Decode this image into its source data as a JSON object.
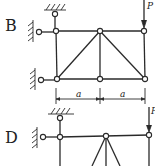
{
  "figure": {
    "type": "truss-diagram-options",
    "options": [
      {
        "label": "B",
        "load_label": "P",
        "dimension_labels": [
          "a",
          "a"
        ],
        "members": "2-panel truss with top and bottom chords, verticals, and two diagonals meeting at top middle joint",
        "supports": [
          "top pin to ceiling at upper-left",
          "left pin to wall at top-left joint",
          "left pin to wall at bottom-left joint"
        ]
      },
      {
        "label": "D",
        "load_label": "P",
        "members": "2-panel truss (partially visible) with top chord, verticals, and diagonals fanning from top middle joint",
        "supports": [
          "top pin to ceiling at upper-left",
          "left pin to wall at top-left joint"
        ]
      }
    ]
  },
  "colors": {
    "line": "#2a2a2a",
    "background": "#ffffff"
  }
}
